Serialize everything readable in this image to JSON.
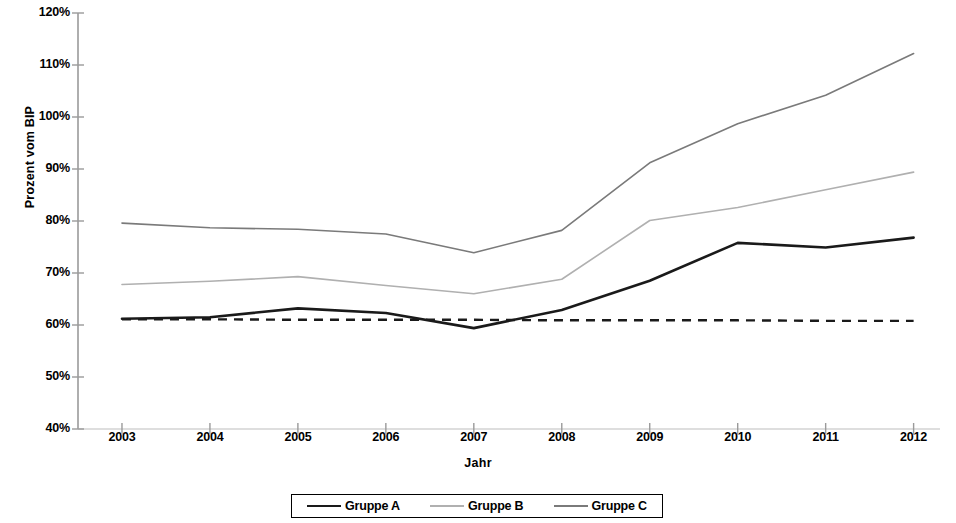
{
  "chart_data": {
    "type": "line",
    "title": "",
    "xlabel": "Jahr",
    "ylabel": "Prozent vom BIP",
    "categories": [
      "2003",
      "2004",
      "2005",
      "2006",
      "2007",
      "2008",
      "2009",
      "2010",
      "2011",
      "2012"
    ],
    "x": [
      2003,
      2004,
      2005,
      2006,
      2007,
      2008,
      2009,
      2010,
      2011,
      2012
    ],
    "xlim": [
      2002.5,
      2012.3
    ],
    "ylim": [
      40,
      120
    ],
    "ytick_labels": [
      "40%",
      "50%",
      "60%",
      "70%",
      "80%",
      "90%",
      "100%",
      "110%",
      "120%"
    ],
    "ytick_values": [
      40,
      50,
      60,
      70,
      80,
      90,
      100,
      110,
      120
    ],
    "y_unit": "%",
    "grid": false,
    "legend_position": "bottom",
    "series": [
      {
        "name": "Gruppe A",
        "color": "#1a1a1a",
        "width": 2.6,
        "dash": "none",
        "values": [
          61.2,
          61.5,
          63.2,
          62.3,
          59.4,
          62.9,
          68.5,
          75.8,
          74.9,
          76.8
        ]
      },
      {
        "name": "Gruppe B",
        "color": "#b0b0b0",
        "width": 1.6,
        "dash": "none",
        "values": [
          67.8,
          68.4,
          69.3,
          67.6,
          66.0,
          68.8,
          80.1,
          82.6,
          86.0,
          89.4
        ]
      },
      {
        "name": "Gruppe C",
        "color": "#7a7a7a",
        "width": 1.6,
        "dash": "none",
        "values": [
          79.6,
          78.7,
          78.4,
          77.5,
          73.9,
          78.2,
          91.2,
          98.7,
          104.2,
          112.2
        ]
      }
    ],
    "reference_line": {
      "name": "Referenzlinie",
      "color": "#1a1a1a",
      "width": 2.4,
      "dash": "9 7",
      "values": [
        61.1,
        61.1,
        61.0,
        61.0,
        61.0,
        60.9,
        60.9,
        60.9,
        60.8,
        60.8
      ]
    }
  },
  "legend": {
    "entries": [
      {
        "label": "Gruppe A"
      },
      {
        "label": "Gruppe B"
      },
      {
        "label": "Gruppe C"
      }
    ]
  }
}
